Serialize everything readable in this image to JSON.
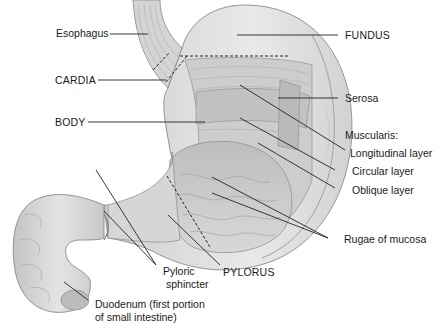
{
  "diagram": {
    "labels": {
      "esophagus": "Esophagus",
      "cardia": "CARDIA",
      "body": "BODY",
      "fundus": "FUNDUS",
      "serosa": "Serosa",
      "muscularis": "Muscularis:",
      "longitudinal": "Longitudinal layer",
      "circular": "Circular layer",
      "oblique": "Oblique layer",
      "rugae": "Rugae of mucosa",
      "pyloric_1": "Pyloric",
      "pyloric_2": "sphincter",
      "pylorus": "PYLORUS",
      "duodenum_1": "Duodenum (first portion",
      "duodenum_2": "of small intestine)"
    },
    "colors": {
      "tissue_light": "#e6e6e6",
      "tissue_mid": "#c9c9c9",
      "tissue_dark": "#9a9a9a",
      "leader_line": "#222222",
      "text": "#1a1a1a"
    }
  }
}
